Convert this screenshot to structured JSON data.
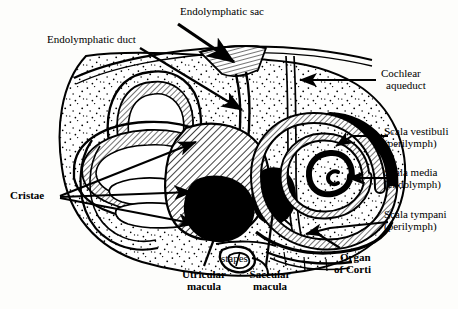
{
  "figure": {
    "background_color": "#fdfdfb",
    "ink_color": "#000000",
    "labels": [
      {
        "id": "endolymphatic-sac",
        "text": "Endolymphatic sac",
        "bold": false,
        "lines": [
          "Endolymphatic sac"
        ]
      },
      {
        "id": "endolymphatic-duct",
        "text": "Endolymphatic duct",
        "bold": false,
        "lines": [
          "Endolymphatic duct"
        ]
      },
      {
        "id": "cochlear-aqueduct",
        "text": "Cochlear aqueduct",
        "bold": false,
        "lines": [
          "Cochlear",
          "aqueduct"
        ]
      },
      {
        "id": "scala-vestibuli",
        "text": "Scala vestibuli (perilymph)",
        "bold": false,
        "lines": [
          "Scala vestibuli",
          "(perilymph)"
        ]
      },
      {
        "id": "scala-media",
        "text": "Scala media (endolymph)",
        "bold": false,
        "lines": [
          "Scala media",
          "(endolymph)"
        ]
      },
      {
        "id": "scala-tympani",
        "text": "Scala tympani (perilymph)",
        "bold": false,
        "lines": [
          "Scala tympani",
          "(perilymph)"
        ]
      },
      {
        "id": "cristae",
        "text": "Cristae",
        "bold": true,
        "lines": [
          "Cristae"
        ]
      },
      {
        "id": "stapes",
        "text": "stapes",
        "bold": false,
        "lines": [
          "stapes"
        ]
      },
      {
        "id": "utricular-macula",
        "text": "Utricular macula",
        "bold": true,
        "lines": [
          "Utricular",
          "macula"
        ]
      },
      {
        "id": "saccular-macula",
        "text": "Saccular macula",
        "bold": true,
        "lines": [
          "Saccular",
          "macula"
        ]
      },
      {
        "id": "organ-of-corti",
        "text": "Organ of Corti",
        "bold": true,
        "lines": [
          "Organ",
          "of Corti"
        ]
      }
    ],
    "label_text": {
      "endolymphatic_sac": "Endolymphatic sac",
      "endolymphatic_duct": "Endolymphatic duct",
      "cochlear_aqueduct_l1": "Cochlear",
      "cochlear_aqueduct_l2": "aqueduct",
      "scala_vestibuli_l1": "Scala vestibuli",
      "scala_vestibuli_l2": "(perilymph)",
      "scala_media_l1": "Scala media",
      "scala_media_l2": "(endolymph)",
      "scala_tympani_l1": "Scala tympani",
      "scala_tympani_l2": "(perilymph)",
      "cristae": "Cristae",
      "stapes": "stapes",
      "utricular_macula_l1": "Utricular",
      "utricular_macula_l2": "macula",
      "saccular_macula_l1": "Saccular",
      "saccular_macula_l2": "macula",
      "organ_of_corti_l1": "Organ",
      "organ_of_corti_l2": "of Corti"
    },
    "structures": [
      "bony-labyrinth-outline",
      "semicircular-canals",
      "ampullae-with-cristae",
      "utricle",
      "saccule",
      "vestibule",
      "oval-window",
      "stapes",
      "endolymphatic-duct",
      "endolymphatic-sac",
      "cochlear-aqueduct",
      "cochlea-spiral",
      "scala-vestibuli",
      "scala-media",
      "scala-tympani",
      "organ-of-corti",
      "round-window"
    ]
  }
}
